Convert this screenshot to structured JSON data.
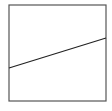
{
  "diagram": {
    "type": "line-in-box",
    "box": {
      "x": 9,
      "y": 5,
      "width": 97,
      "height": 96,
      "stroke": "#555555",
      "stroke_width": 1.2
    },
    "line": {
      "x1": 9,
      "y1": 68,
      "x2": 106,
      "y2": 38,
      "stroke": "#222222",
      "stroke_width": 1.2
    },
    "background": "#ffffff"
  }
}
